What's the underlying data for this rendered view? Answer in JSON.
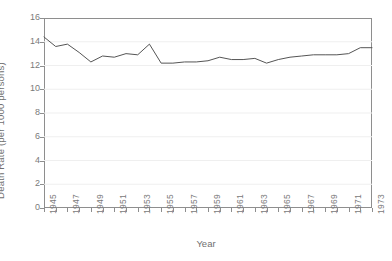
{
  "chart_data": {
    "type": "line",
    "title": "",
    "xlabel": "Year",
    "ylabel": "Death Rate (per 1000 persons)",
    "xlim": [
      1945,
      1973
    ],
    "ylim": [
      0,
      16
    ],
    "y_ticks": [
      0,
      2,
      4,
      6,
      8,
      10,
      12,
      14,
      16
    ],
    "x_ticks": [
      1945,
      1946,
      1947,
      1948,
      1949,
      1950,
      1951,
      1952,
      1953,
      1954,
      1955,
      1956,
      1957,
      1958,
      1959,
      1960,
      1961,
      1962,
      1963,
      1964,
      1965,
      1966,
      1967,
      1968,
      1969,
      1970,
      1971,
      1972,
      1973
    ],
    "x_tick_labels": [
      "1945",
      "",
      "1947",
      "",
      "1949",
      "",
      "1951",
      "",
      "1953",
      "",
      "1955",
      "",
      "1957",
      "",
      "1959",
      "",
      "1961",
      "",
      "1963",
      "",
      "1965",
      "",
      "1967",
      "",
      "1969",
      "",
      "1971",
      "",
      "1973"
    ],
    "grid": true,
    "legend": "none",
    "line_color": "#555555",
    "axis_color": "#8e8e8e",
    "grid_color": "#efefef",
    "x": [
      1945,
      1946,
      1947,
      1948,
      1949,
      1950,
      1951,
      1952,
      1953,
      1954,
      1955,
      1956,
      1957,
      1958,
      1959,
      1960,
      1961,
      1962,
      1963,
      1964,
      1965,
      1966,
      1967,
      1968,
      1969,
      1970,
      1971,
      1972,
      1973
    ],
    "values": [
      14.4,
      13.6,
      13.8,
      13.1,
      12.3,
      12.8,
      12.7,
      13.0,
      12.9,
      13.8,
      12.2,
      12.2,
      12.3,
      12.3,
      12.4,
      12.7,
      12.5,
      12.5,
      12.6,
      12.2,
      12.5,
      12.7,
      12.8,
      12.9,
      12.9,
      12.9,
      13.0,
      13.5,
      13.5
    ],
    "series": [
      {
        "name": "Death Rate",
        "values": [
          14.4,
          13.6,
          13.8,
          13.1,
          12.3,
          12.8,
          12.7,
          13.0,
          12.9,
          13.8,
          12.2,
          12.2,
          12.3,
          12.3,
          12.4,
          12.7,
          12.5,
          12.5,
          12.6,
          12.2,
          12.5,
          12.7,
          12.8,
          12.9,
          12.9,
          12.9,
          13.0,
          13.5,
          13.5
        ]
      }
    ]
  }
}
